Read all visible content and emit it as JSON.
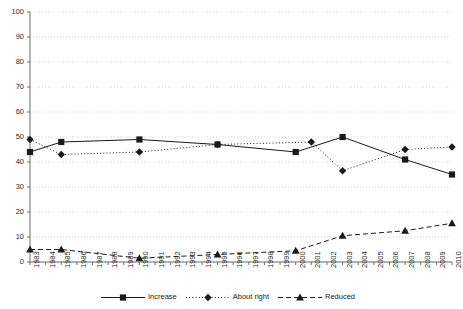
{
  "chart_data": {
    "type": "line",
    "title": "",
    "xlabel": "",
    "ylabel": "",
    "ylim": [
      0,
      100
    ],
    "ytick_step": 10,
    "yticks": [
      "0",
      "10",
      "20",
      "30",
      "40",
      "50",
      "60",
      "70",
      "80",
      "90",
      "100"
    ],
    "grid": true,
    "legend_position": "bottom",
    "categories": [
      "1983",
      "1984",
      "1985",
      "1986",
      "1987",
      "1988",
      "1989",
      "1990",
      "1991",
      "1992",
      "1993",
      "1994",
      "1995",
      "1996",
      "1997",
      "1998",
      "1999",
      "2000",
      "2001",
      "2002",
      "2003",
      "2004",
      "2005",
      "2006",
      "2007",
      "2008",
      "2009",
      "2010"
    ],
    "series": [
      {
        "name": "Increase",
        "line_style": "solid",
        "marker": "square",
        "color": "#1a1a1a",
        "points": [
          {
            "x": "1983",
            "y": 44
          },
          {
            "x": "1985",
            "y": 48
          },
          {
            "x": "1990",
            "y": 49
          },
          {
            "x": "1995",
            "y": 47
          },
          {
            "x": "2000",
            "y": 44
          },
          {
            "x": "2003",
            "y": 50
          },
          {
            "x": "2007",
            "y": 41
          },
          {
            "x": "2010",
            "y": 35
          }
        ]
      },
      {
        "name": "About right",
        "line_style": "dotted",
        "marker": "diamond",
        "color": "#1a1a1a",
        "points": [
          {
            "x": "1983",
            "y": 49
          },
          {
            "x": "1985",
            "y": 43
          },
          {
            "x": "1990",
            "y": 44
          },
          {
            "x": "1995",
            "y": 47
          },
          {
            "x": "2001",
            "y": 48
          },
          {
            "x": "2003",
            "y": 36.5
          },
          {
            "x": "2007",
            "y": 45
          },
          {
            "x": "2010",
            "y": 46
          }
        ]
      },
      {
        "name": "Reduced",
        "line_style": "dashed",
        "marker": "triangle",
        "color": "#1a1a1a",
        "points": [
          {
            "x": "1983",
            "y": 5
          },
          {
            "x": "1985",
            "y": 5
          },
          {
            "x": "1990",
            "y": 1.5
          },
          {
            "x": "1995",
            "y": 3
          },
          {
            "x": "2000",
            "y": 4.5
          },
          {
            "x": "2003",
            "y": 10.5
          },
          {
            "x": "2007",
            "y": 12.5
          },
          {
            "x": "2010",
            "y": 15.5
          }
        ]
      }
    ]
  },
  "legend": {
    "items": [
      {
        "label": "Increase"
      },
      {
        "label": "About right"
      },
      {
        "label": "Reduced"
      }
    ]
  },
  "colors": {
    "axis": "#6e6e6e",
    "grid": "#c9c9c9",
    "series": "#1a1a1a",
    "text": "#1a1a1a"
  }
}
